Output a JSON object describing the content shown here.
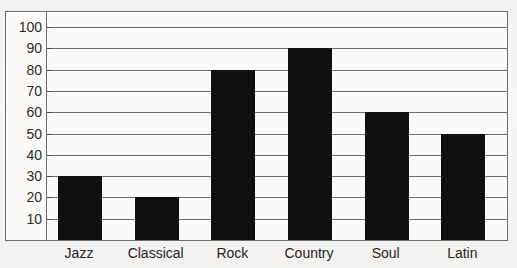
{
  "chart_data": {
    "type": "bar",
    "title": "",
    "xlabel": "",
    "ylabel": "",
    "categories": [
      "Jazz",
      "Classical",
      "Rock",
      "Country",
      "Soul",
      "Latin"
    ],
    "values": [
      30,
      20,
      80,
      90,
      60,
      50
    ],
    "ylim": [
      0,
      100
    ],
    "ytick_labels": [
      "100",
      "90",
      "80",
      "70",
      "60",
      "50",
      "40",
      "30",
      "20",
      "10"
    ],
    "ytick_values": [
      100,
      90,
      80,
      70,
      60,
      50,
      40,
      30,
      20,
      10
    ],
    "ystep": 10,
    "grid": true,
    "legend": false,
    "bar_color": "#111010",
    "grid_color": "#6f6d6b",
    "frame_color": "#6e6c6a",
    "background_color": "#fbfaf8"
  },
  "ghost_title": "ghost descenders of cropped title"
}
